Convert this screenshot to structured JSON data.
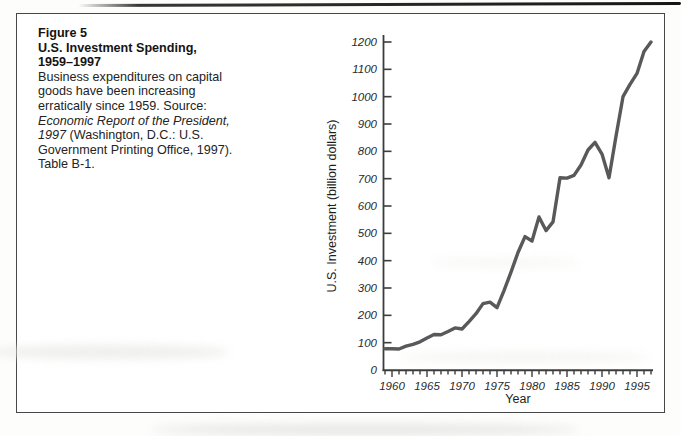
{
  "figure_panel": {
    "label": "Figure 5",
    "title": "U.S. Investment Spending,",
    "title_years": "1959–1997",
    "caption_pre": "Business expenditures on capital goods have been increasing erratically since 1959. Source: ",
    "caption_italic": "Economic Report of the President, 1997",
    "caption_post": " (Washington, D.C.: U.S. Government Printing Office, 1997). Table B-1."
  },
  "chart_data": {
    "type": "line",
    "title": "U.S. Investment Spending, 1959–1997",
    "xlabel": "Year",
    "ylabel": "U.S. Investment (billion dollars)",
    "xlim": [
      1959,
      1997
    ],
    "ylim": [
      0,
      1200
    ],
    "grid": false,
    "legend": "none",
    "line_color": "#58595b",
    "axis_color": "#3c3c3c",
    "y_ticks": [
      0,
      100,
      200,
      300,
      400,
      500,
      600,
      700,
      800,
      900,
      1000,
      1100,
      1200
    ],
    "x_labeled_years": [
      1960,
      1965,
      1970,
      1975,
      1980,
      1985,
      1990,
      1995
    ],
    "series": [
      {
        "name": "U.S. Investment",
        "x": [
          1959,
          1960,
          1961,
          1962,
          1963,
          1964,
          1965,
          1966,
          1967,
          1968,
          1969,
          1970,
          1971,
          1972,
          1973,
          1974,
          1975,
          1976,
          1977,
          1978,
          1979,
          1980,
          1981,
          1982,
          1983,
          1984,
          1985,
          1986,
          1987,
          1988,
          1989,
          1990,
          1991,
          1992,
          1993,
          1994,
          1995,
          1996,
          1997
        ],
        "values": [
          78,
          78,
          77,
          87,
          94,
          103,
          117,
          130,
          129,
          141,
          154,
          150,
          177,
          206,
          243,
          248,
          228,
          290,
          358,
          430,
          488,
          472,
          560,
          510,
          542,
          703,
          702,
          712,
          750,
          805,
          833,
          790,
          703,
          855,
          1000,
          1045,
          1085,
          1165,
          1200
        ]
      }
    ]
  }
}
